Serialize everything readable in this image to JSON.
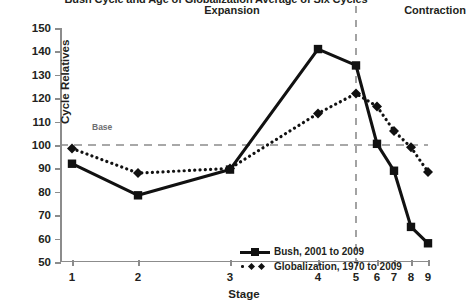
{
  "chart_data": {
    "type": "line",
    "title": "Bush Cycle and Age of Globalization Average of Six Cycles",
    "xlabel": "Stage",
    "ylabel": "Cycle Relatives",
    "categories": [
      "1",
      "2",
      "3",
      "4",
      "5",
      "6",
      "7",
      "8",
      "9"
    ],
    "x": [
      1,
      2,
      3,
      4,
      5,
      6,
      7,
      8,
      9
    ],
    "ylim": [
      50,
      150
    ],
    "yticks": [
      50,
      60,
      70,
      80,
      90,
      100,
      110,
      120,
      130,
      140,
      150
    ],
    "grid": false,
    "legend_position": "inside-bottom-center",
    "series": [
      {
        "name": "Bush, 2001 to 2009",
        "values": [
          92,
          78.5,
          89.5,
          141,
          134,
          100.5,
          89,
          65,
          58
        ],
        "marker": "square",
        "linestyle": "solid",
        "color": "#111111"
      },
      {
        "name": "Globalization, 1970 to 2009",
        "values": [
          98.5,
          88,
          90,
          113.5,
          122,
          116.5,
          106,
          99,
          88.5
        ],
        "marker": "diamond",
        "linestyle": "dotted",
        "color": "#111111"
      }
    ],
    "annotations": [
      {
        "text": "Expansion",
        "type": "phase-label",
        "at_x": 3.0
      },
      {
        "text": "Contraction",
        "type": "phase-label",
        "at_x": 7.2
      },
      {
        "text": "Base",
        "type": "reference-label",
        "value": 100
      }
    ],
    "reference_lines": [
      {
        "name": "base-line",
        "orientation": "horizontal",
        "value": 100,
        "style": "dashed",
        "color": "#8c8c8c"
      },
      {
        "name": "phase-divider",
        "orientation": "vertical",
        "value": 5,
        "style": "dashed",
        "color": "#8c8c8c"
      }
    ]
  },
  "legend": {
    "items": [
      {
        "label": "Bush, 2001 to 2009"
      },
      {
        "label": "Globalization, 1970 to 2009"
      }
    ]
  }
}
